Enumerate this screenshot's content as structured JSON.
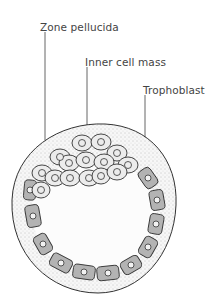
{
  "labels": [
    {
      "id": "zona",
      "text": "Zone pellucida",
      "x": 40,
      "y": 19
    },
    {
      "id": "icm",
      "text": "Inner cell mass",
      "x": 85,
      "y": 55
    },
    {
      "id": "troph",
      "text": "Trophoblast",
      "x": 143,
      "y": 83
    }
  ],
  "colors": {
    "outline": "#333333",
    "zona_fill": "#f6f6f6",
    "cavity_fill": "#fbfbfb",
    "icm_cell_fill": "#eeeeee",
    "troph_cell_fill": "#b5b5b5"
  }
}
